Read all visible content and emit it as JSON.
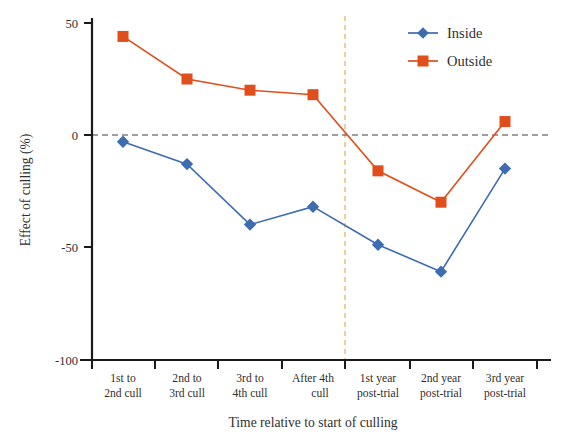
{
  "chart_data": {
    "type": "line",
    "title": "",
    "xlabel": "Time relative to start of culling",
    "ylabel": "Effect of culling (%)",
    "categories": [
      "1st to 2nd cull",
      "2nd to 3rd cull",
      "3rd to 4th cull",
      "After 4th cull",
      "1st year post-trial",
      "2nd year post-trial",
      "3rd year post-trial"
    ],
    "category_lines": [
      [
        "1st to",
        "2nd cull"
      ],
      [
        "2nd to",
        "3rd cull"
      ],
      [
        "3rd to",
        "4th cull"
      ],
      [
        "After 4th",
        "cull"
      ],
      [
        "1st year",
        "post-trial"
      ],
      [
        "2nd year",
        "post-trial"
      ],
      [
        "3rd year",
        "post-trial"
      ]
    ],
    "series": [
      {
        "name": "Inside",
        "color": "#3D6CB0",
        "marker": "diamond",
        "values": [
          -3,
          -13,
          -40,
          -32,
          -49,
          -61,
          -15
        ]
      },
      {
        "name": "Outside",
        "color": "#E04E1B",
        "marker": "square",
        "values": [
          44,
          25,
          20,
          18,
          -16,
          -30,
          6
        ]
      }
    ],
    "ylim": [
      -100,
      50
    ],
    "yticks": [
      50,
      0,
      -50,
      -100
    ],
    "ytick_labels": [
      "50",
      "0",
      "-50",
      "-100"
    ],
    "grid": false,
    "legend_position": "top-right",
    "annotations": {
      "zero_reference_line": {
        "orientation": "horizontal",
        "value": 0,
        "style": "dashed",
        "color": "#444444"
      },
      "trial_end_line": {
        "orientation": "vertical",
        "between_categories": [
          "After 4th cull",
          "1st year post-trial"
        ],
        "style": "dashed",
        "color": "#D9A441"
      }
    }
  },
  "legend": {
    "items": [
      {
        "label": "Inside",
        "color": "#3D6CB0",
        "marker": "diamond"
      },
      {
        "label": "Outside",
        "color": "#E04E1B",
        "marker": "square"
      }
    ]
  }
}
